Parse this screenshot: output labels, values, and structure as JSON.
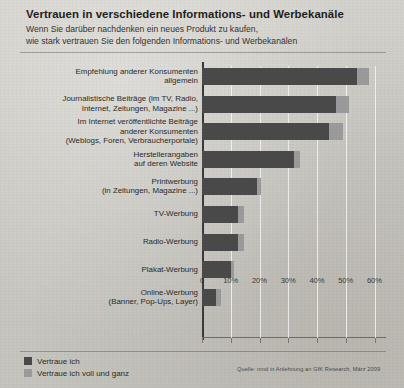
{
  "header": {
    "title": "Vertrauen in verschiedene Informations- und Werbekanäle",
    "subtitle_line1": "Wenn Sie darüber nachdenken ein neues Produkt zu kaufen,",
    "subtitle_line2": "wie stark vertrauen Sie den folgenden Informations- und Werbekanälen"
  },
  "source": "Quelle: nmd in Anlehnung an GfK Research, März 2009",
  "legend": {
    "position": "bottom-left",
    "items": [
      {
        "label": "Vertraue ich",
        "color": "#4a4a4a"
      },
      {
        "label": "Vertraue ich voll und ganz",
        "color": "#9b9b9b"
      }
    ]
  },
  "colors": {
    "series_trust": "#4a4a4a",
    "series_full_trust": "#9b9b9b",
    "background": "#cfcdc8",
    "gridline": "#ffffff",
    "axis": "#3a3a3a"
  },
  "chart_data": {
    "type": "bar",
    "orientation": "horizontal",
    "stacked": true,
    "title": "Vertrauen in verschiedene Informations- und Werbekanäle",
    "subtitle": "Wenn Sie darüber nachdenken ein neues Produkt zu kaufen, wie stark vertrauen Sie den folgenden Informations- und Werbekanälen",
    "xlabel": "",
    "ylabel": "",
    "xlim": [
      0,
      64
    ],
    "grid": true,
    "legend_position": "bottom-left",
    "tick_labels": [
      "0",
      "10%",
      "20%",
      "30%",
      "40%",
      "50%",
      "60%"
    ],
    "tick_values": [
      0,
      10,
      20,
      30,
      40,
      50,
      60
    ],
    "categories": [
      "Empfehlung anderer Konsumenten\nallgemein",
      "Journalistische Beiträge (im TV, Radio,\nInternet, Zeitungen, Magazine ...)",
      "Im Internet veröffentlichte Beiträge\nanderer Konsumenten\n(Weblogs, Foren, Verbraucherportale)",
      "Herstellerangaben\nauf deren Website",
      "Printwerbung\n(in Zeitungen, Magazine ...)",
      "TV-Werbung",
      "Radio-Werbung",
      "Plakat-Werbung",
      "Online-Werbung\n(Banner, Pop-Ups, Layer)"
    ],
    "series": [
      {
        "name": "Vertraue ich",
        "color": "#4a4a4a",
        "values": [
          54,
          46.5,
          44,
          32,
          19,
          12.5,
          12.5,
          10,
          5
        ]
      },
      {
        "name": "Vertraue ich voll und ganz",
        "color": "#9b9b9b",
        "values": [
          4,
          4.5,
          5,
          2,
          1.5,
          2,
          2,
          1,
          1.5
        ]
      }
    ],
    "totals": [
      58,
      51,
      49,
      34,
      20.5,
      14.5,
      14.5,
      11,
      6.5
    ]
  }
}
